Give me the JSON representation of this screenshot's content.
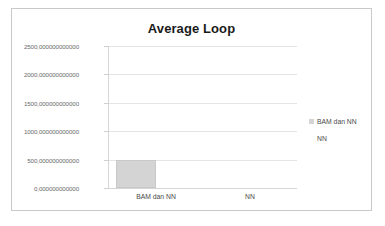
{
  "chart_data": {
    "type": "bar",
    "title": "Average Loop",
    "xlabel": "",
    "ylabel": "",
    "categories": [
      "BAM dan NN",
      "NN"
    ],
    "series": [
      {
        "name": "BAM dan NN",
        "values": [
          500,
          0
        ],
        "color": "#d4d4d4"
      },
      {
        "name": "NN",
        "values": [
          0,
          0
        ],
        "color": "#ffffff"
      }
    ],
    "ylim": [
      0,
      2500
    ],
    "ytick_values": [
      0,
      500,
      1000,
      1500,
      2000,
      2500
    ],
    "ytick_labels": [
      "0,000000000000",
      "500,000000000000",
      "1000,000000000000",
      "1500,000000000000",
      "2000,000000000000",
      "2500,000000000000"
    ],
    "grid": true,
    "legend_position": "right",
    "legend_entries": [
      "BAM dan NN",
      "NN"
    ]
  },
  "colors": {
    "bar_fill": "#d4d4d4",
    "bar_stroke": "#c8c8c8",
    "gridline": "#e4e4e4",
    "axis": "#d6d6d6",
    "frame_border": "#c9c9c9",
    "title_text": "#1a1a1a",
    "tick_text": "#6b6b6b",
    "label_text": "#4a4a4a"
  }
}
